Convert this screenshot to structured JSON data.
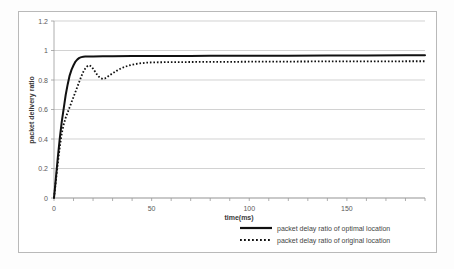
{
  "chart_data": {
    "type": "line",
    "title": "",
    "xlabel": "time(ms)",
    "ylabel": "packet delivery ratio",
    "xlim": [
      0,
      190
    ],
    "ylim": [
      0,
      1.2
    ],
    "grid": true,
    "legend_position": "bottom-right",
    "x_ticks": [
      "0",
      "50",
      "100",
      "150"
    ],
    "x_tick_values": [
      0,
      50,
      100,
      150
    ],
    "y_ticks": [
      "0",
      "0.2",
      "0.4",
      "0.6",
      "0.8",
      "1",
      "1.2"
    ],
    "y_tick_values": [
      0,
      0.2,
      0.4,
      0.6,
      0.8,
      1,
      1.2
    ],
    "series": [
      {
        "name": "packet delay ratio of optimal location",
        "style": "solid",
        "color": "#111111",
        "x": [
          0,
          1,
          2,
          3,
          4,
          5,
          6,
          7,
          8,
          9,
          10,
          11,
          12,
          13,
          14,
          15,
          16,
          18,
          20,
          25,
          30,
          40,
          50,
          60,
          70,
          80,
          90,
          100,
          120,
          140,
          160,
          180,
          190
        ],
        "y": [
          0.0,
          0.14,
          0.28,
          0.41,
          0.52,
          0.61,
          0.7,
          0.77,
          0.83,
          0.87,
          0.9,
          0.925,
          0.94,
          0.95,
          0.955,
          0.958,
          0.959,
          0.96,
          0.96,
          0.961,
          0.961,
          0.962,
          0.962,
          0.963,
          0.963,
          0.964,
          0.964,
          0.965,
          0.965,
          0.966,
          0.966,
          0.967,
          0.967
        ]
      },
      {
        "name": "packet delay ratio of original location",
        "style": "dotted",
        "color": "#111111",
        "x": [
          0,
          1,
          2,
          3,
          4,
          5,
          6,
          7,
          8,
          9,
          10,
          11,
          12,
          13,
          14,
          15,
          16,
          17,
          18,
          19,
          20,
          21,
          22,
          23,
          24,
          25,
          26,
          27,
          28,
          30,
          32,
          34,
          36,
          38,
          40,
          44,
          48,
          52,
          60,
          70,
          80,
          90,
          100,
          120,
          140,
          160,
          180,
          190
        ],
        "y": [
          0.0,
          0.12,
          0.24,
          0.35,
          0.44,
          0.5,
          0.545,
          0.58,
          0.615,
          0.65,
          0.685,
          0.72,
          0.755,
          0.79,
          0.825,
          0.855,
          0.878,
          0.893,
          0.9,
          0.893,
          0.877,
          0.857,
          0.838,
          0.822,
          0.812,
          0.808,
          0.81,
          0.818,
          0.828,
          0.845,
          0.862,
          0.876,
          0.888,
          0.897,
          0.904,
          0.913,
          0.918,
          0.92,
          0.921,
          0.922,
          0.923,
          0.923,
          0.924,
          0.925,
          0.926,
          0.926,
          0.927,
          0.927
        ]
      }
    ]
  },
  "legend": {
    "items": [
      {
        "label": "packet delay ratio of optimal location",
        "style": "solid"
      },
      {
        "label": "packet delay ratio of original location",
        "style": "dotted"
      }
    ]
  }
}
